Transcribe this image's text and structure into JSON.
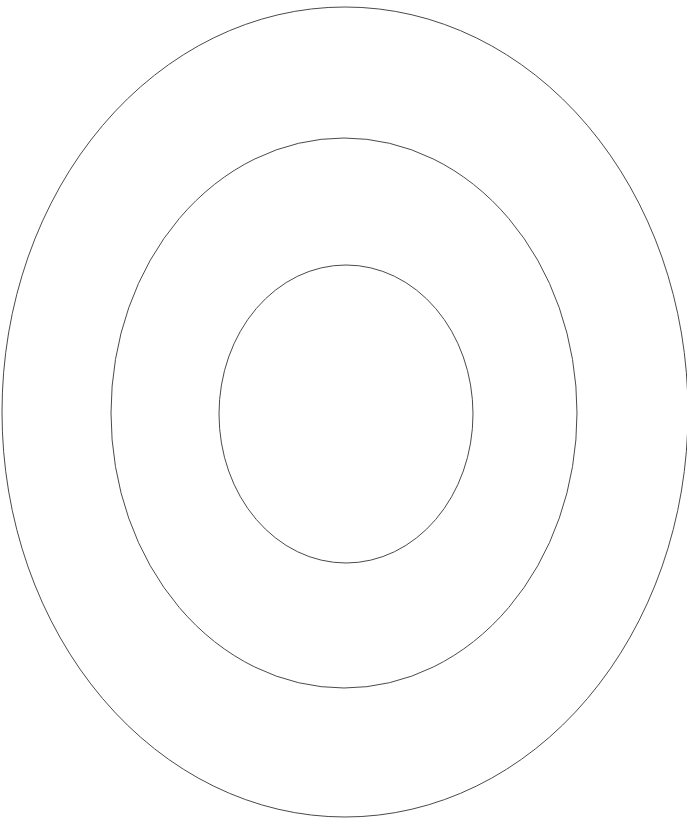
{
  "canvas": {
    "width": 687,
    "height": 828,
    "background_color": "#ffffff",
    "title": "Concentric Ellipses"
  },
  "chart_data": {
    "type": "scatter",
    "title": "",
    "subtitle": "",
    "xlabel": "",
    "ylabel": "",
    "grid": false,
    "legend_position": "none",
    "axis_visible": false,
    "tick_labels": [],
    "annotations": [],
    "shared_center": {
      "cx": 345,
      "cy": 413
    },
    "stroke_color": "#4a4a4a",
    "stroke_width": 1,
    "fill": "none",
    "shape_count": 3,
    "shapes": [
      {
        "name": "outer-ellipse",
        "index": 0,
        "cx": 345,
        "cy": 412,
        "rx": 343,
        "ry": 405,
        "left": 2,
        "right": 688,
        "top": 7,
        "bottom": 817,
        "stroke": "#4a4a4a",
        "stroke_width": 1,
        "fill": "none",
        "clipped_right_edge": true
      },
      {
        "name": "middle-ellipse",
        "index": 1,
        "cx": 344,
        "cy": 413,
        "rx": 233,
        "ry": 275,
        "left": 111,
        "right": 577,
        "top": 138,
        "bottom": 688,
        "stroke": "#4a4a4a",
        "stroke_width": 1,
        "fill": "none",
        "clipped_right_edge": false
      },
      {
        "name": "inner-ellipse",
        "index": 2,
        "cx": 346,
        "cy": 414,
        "rx": 127,
        "ry": 149,
        "left": 219,
        "right": 473,
        "top": 265,
        "bottom": 563,
        "stroke": "#4a4a4a",
        "stroke_width": 1,
        "fill": "none",
        "clipped_right_edge": false
      }
    ]
  }
}
